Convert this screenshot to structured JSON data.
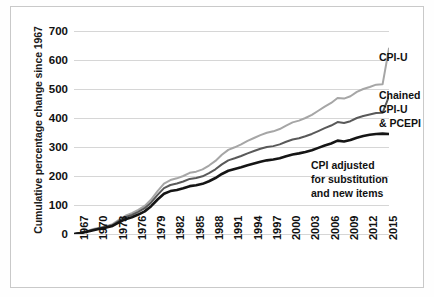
{
  "chart_data": {
    "type": "line",
    "title": "",
    "xlabel": "",
    "ylabel": "Cumulative percentage change since 1967",
    "ylim": [
      0,
      700
    ],
    "xlim": [
      1967,
      2016
    ],
    "grid": true,
    "legend_position": "inline-right-of-line-ends",
    "yticks": [
      "0",
      "100",
      "200",
      "300",
      "400",
      "500",
      "600",
      "700"
    ],
    "xticks": [
      "1967",
      "1970",
      "1973",
      "1976",
      "1979",
      "1982",
      "1985",
      "1988",
      "1991",
      "1994",
      "1997",
      "2000",
      "2003",
      "2006",
      "2009",
      "2012",
      "2015"
    ],
    "x": [
      1967,
      1968,
      1969,
      1970,
      1971,
      1972,
      1973,
      1974,
      1975,
      1976,
      1977,
      1978,
      1979,
      1980,
      1981,
      1982,
      1983,
      1984,
      1985,
      1986,
      1987,
      1988,
      1989,
      1990,
      1991,
      1992,
      1993,
      1994,
      1995,
      1996,
      1997,
      1998,
      1999,
      2000,
      2001,
      2002,
      2003,
      2004,
      2005,
      2006,
      2007,
      2008,
      2009,
      2010,
      2011,
      2012,
      2013,
      2014,
      2015,
      2016
    ],
    "series": [
      {
        "name": "CPI-U",
        "color": "#a6a6a6",
        "label_lines": [
          "CPI-U"
        ],
        "values": [
          0,
          4,
          10,
          17,
          22,
          27,
          34,
          49,
          63,
          72,
          83,
          97,
          119,
          148,
          174,
          186,
          192,
          200,
          211,
          215,
          223,
          236,
          252,
          273,
          290,
          299,
          309,
          321,
          331,
          341,
          349,
          354,
          362,
          374,
          385,
          391,
          400,
          411,
          425,
          439,
          452,
          469,
          467,
          475,
          490,
          500,
          507,
          515,
          516,
          640
        ]
      },
      {
        "name": "Chained CPI-U & PCEPI",
        "color": "#595959",
        "label_lines": [
          "Chained",
          "CPI-U",
          "& PCEPI"
        ],
        "values": [
          0,
          4,
          9,
          15,
          20,
          25,
          31,
          45,
          58,
          66,
          76,
          89,
          109,
          135,
          158,
          169,
          174,
          181,
          190,
          193,
          199,
          210,
          223,
          240,
          254,
          261,
          269,
          278,
          286,
          294,
          300,
          303,
          309,
          318,
          326,
          330,
          337,
          345,
          355,
          365,
          374,
          386,
          383,
          389,
          400,
          407,
          412,
          417,
          418,
          475
        ]
      },
      {
        "name": "CPI adjusted for substitution and new items",
        "color": "#151515",
        "label_lines": [
          "CPI adjusted",
          "for substitution",
          "and new items"
        ],
        "values": [
          0,
          3,
          8,
          13,
          18,
          22,
          28,
          40,
          51,
          58,
          67,
          78,
          96,
          119,
          139,
          148,
          152,
          158,
          165,
          168,
          173,
          182,
          193,
          207,
          218,
          224,
          230,
          237,
          243,
          249,
          254,
          257,
          261,
          268,
          274,
          278,
          283,
          289,
          297,
          305,
          312,
          322,
          319,
          324,
          332,
          338,
          342,
          345,
          346,
          345
        ]
      }
    ]
  },
  "annotations": {
    "cpiu": "CPI-U",
    "chained_l1": "Chained",
    "chained_l2": "CPI-U",
    "chained_l3": "& PCEPI",
    "adjusted_l1": "CPI adjusted",
    "adjusted_l2": "for substitution",
    "adjusted_l3": "and new items"
  }
}
